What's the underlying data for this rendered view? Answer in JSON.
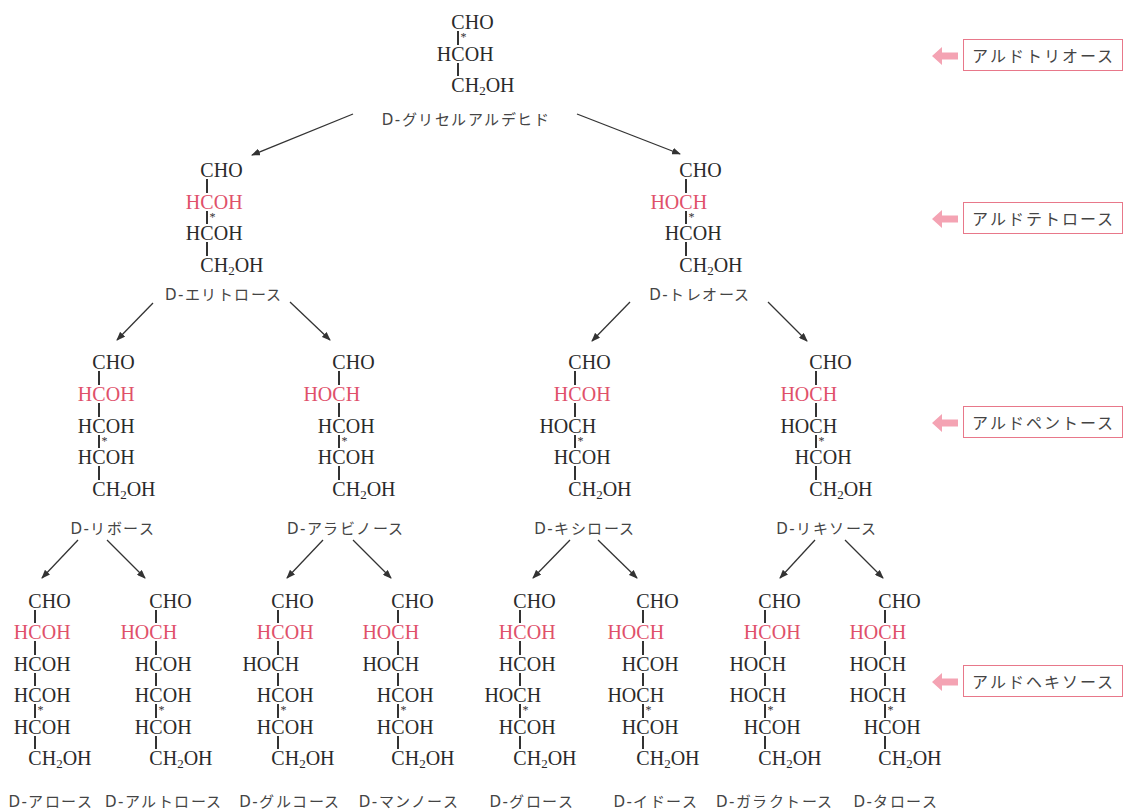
{
  "colors": {
    "highlight": "#e0506a",
    "level_box_border": "#e8788a",
    "level_arrow": "#f4a3b3",
    "text": "#2a2a2a"
  },
  "levels": [
    {
      "label": "アルドトリオース",
      "icon": "left-arrow-icon"
    },
    {
      "label": "アルドテトロース",
      "icon": "left-arrow-icon"
    },
    {
      "label": "アルドペントース",
      "icon": "left-arrow-icon"
    },
    {
      "label": "アルドヘキソース",
      "icon": "left-arrow-icon"
    }
  ],
  "trioses": [
    {
      "name": "D-グリセルアルデヒド",
      "rows": [
        "CHO",
        "HCOH",
        "CH₂OH"
      ],
      "highlight_row": null,
      "star_bond": 0,
      "children": [
        "D-エリトロース",
        "D-トレオース"
      ]
    }
  ],
  "tetroses": [
    {
      "name": "D-エリトロース",
      "rows": [
        "CHO",
        "HCOH",
        "HCOH",
        "CH₂OH"
      ],
      "highlight_row": 1,
      "star_bond": 1,
      "children": [
        "D-リボース",
        "D-アラビノース"
      ]
    },
    {
      "name": "D-トレオース",
      "rows": [
        "CHO",
        "HOCH",
        "HCOH",
        "CH₂OH"
      ],
      "highlight_row": 1,
      "star_bond": 1,
      "children": [
        "D-キシロース",
        "D-リキソース"
      ]
    }
  ],
  "pentoses": [
    {
      "name": "D-リボース",
      "rows": [
        "CHO",
        "HCOH",
        "HCOH",
        "HCOH",
        "CH₂OH"
      ],
      "highlight_row": 1,
      "star_bond": 2,
      "children": [
        "D-アロース",
        "D-アルトロース"
      ]
    },
    {
      "name": "D-アラビノース",
      "rows": [
        "CHO",
        "HOCH",
        "HCOH",
        "HCOH",
        "CH₂OH"
      ],
      "highlight_row": 1,
      "star_bond": 2,
      "children": [
        "D-グルコース",
        "D-マンノース"
      ]
    },
    {
      "name": "D-キシロース",
      "rows": [
        "CHO",
        "HCOH",
        "HOCH",
        "HCOH",
        "CH₂OH"
      ],
      "highlight_row": 1,
      "star_bond": 2,
      "children": [
        "D-グロース",
        "D-イドース"
      ]
    },
    {
      "name": "D-リキソース",
      "rows": [
        "CHO",
        "HOCH",
        "HOCH",
        "HCOH",
        "CH₂OH"
      ],
      "highlight_row": 1,
      "star_bond": 2,
      "children": [
        "D-ガラクトース",
        "D-タロース"
      ]
    }
  ],
  "hexoses": [
    {
      "name": "D-アロース",
      "rows": [
        "CHO",
        "HCOH",
        "HCOH",
        "HCOH",
        "HCOH",
        "CH₂OH"
      ],
      "highlight_row": 1,
      "star_bond": 3
    },
    {
      "name": "D-アルトロース",
      "rows": [
        "CHO",
        "HOCH",
        "HCOH",
        "HCOH",
        "HCOH",
        "CH₂OH"
      ],
      "highlight_row": 1,
      "star_bond": 3
    },
    {
      "name": "D-グルコース",
      "rows": [
        "CHO",
        "HCOH",
        "HOCH",
        "HCOH",
        "HCOH",
        "CH₂OH"
      ],
      "highlight_row": 1,
      "star_bond": 3
    },
    {
      "name": "D-マンノース",
      "rows": [
        "CHO",
        "HOCH",
        "HOCH",
        "HCOH",
        "HCOH",
        "CH₂OH"
      ],
      "highlight_row": 1,
      "star_bond": 3
    },
    {
      "name": "D-グロース",
      "rows": [
        "CHO",
        "HCOH",
        "HCOH",
        "HOCH",
        "HCOH",
        "CH₂OH"
      ],
      "highlight_row": 1,
      "star_bond": 3
    },
    {
      "name": "D-イドース",
      "rows": [
        "CHO",
        "HOCH",
        "HCOH",
        "HOCH",
        "HCOH",
        "CH₂OH"
      ],
      "highlight_row": 1,
      "star_bond": 3
    },
    {
      "name": "D-ガラクトース",
      "rows": [
        "CHO",
        "HCOH",
        "HOCH",
        "HOCH",
        "HCOH",
        "CH₂OH"
      ],
      "highlight_row": 1,
      "star_bond": 3
    },
    {
      "name": "D-タロース",
      "rows": [
        "CHO",
        "HOCH",
        "HOCH",
        "HOCH",
        "HCOH",
        "CH₂OH"
      ],
      "highlight_row": 1,
      "star_bond": 3
    }
  ]
}
